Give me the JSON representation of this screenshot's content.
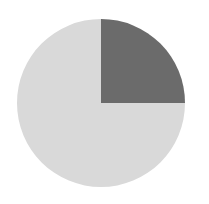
{
  "chart_data": {
    "type": "pie",
    "title": "",
    "labels": [
      "",
      ""
    ],
    "values": [
      25,
      75
    ],
    "colors": [
      "#6b6b6b",
      "#d9d9d9"
    ],
    "start_angle_deg": 0,
    "direction": "clockwise_from_top",
    "legend": "none",
    "center": [
      101,
      103
    ],
    "radius": 84
  }
}
